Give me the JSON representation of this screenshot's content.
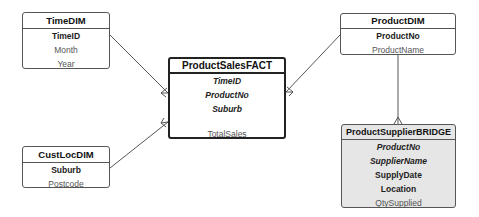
{
  "diagram": {
    "type": "star-schema-er",
    "entities": {
      "time_dim": {
        "title": "TimeDIM",
        "attributes": [
          {
            "name": "TimeID",
            "style": "pk"
          },
          {
            "name": "Month",
            "style": "plain"
          },
          {
            "name": "Year",
            "style": "plain"
          }
        ]
      },
      "cust_loc_dim": {
        "title": "CustLocDIM",
        "attributes": [
          {
            "name": "Suburb",
            "style": "pk"
          },
          {
            "name": "Postcode",
            "style": "plain"
          }
        ]
      },
      "product_sales_fact": {
        "title": "ProductSalesFACT",
        "attributes": [
          {
            "name": "TimeID",
            "style": "fk"
          },
          {
            "name": "ProductNo",
            "style": "fk"
          },
          {
            "name": "Suburb",
            "style": "fk"
          },
          {
            "name": "TotalSales",
            "style": "plain"
          }
        ]
      },
      "product_dim": {
        "title": "ProductDIM",
        "attributes": [
          {
            "name": "ProductNo",
            "style": "pk"
          },
          {
            "name": "ProductName",
            "style": "plain"
          }
        ]
      },
      "product_supplier_bridge": {
        "title": "ProductSupplierBRIDGE",
        "attributes": [
          {
            "name": "ProductNo",
            "style": "fk"
          },
          {
            "name": "SupplierName",
            "style": "fk"
          },
          {
            "name": "SupplyDate",
            "style": "pk"
          },
          {
            "name": "Location",
            "style": "pk"
          },
          {
            "name": "QtySupplied",
            "style": "plain"
          }
        ]
      }
    },
    "relationships": [
      {
        "from": "TimeDIM",
        "to": "ProductSalesFACT",
        "cardinality": "one-to-many"
      },
      {
        "from": "CustLocDIM",
        "to": "ProductSalesFACT",
        "cardinality": "one-to-many"
      },
      {
        "from": "ProductDIM",
        "to": "ProductSalesFACT",
        "cardinality": "one-to-many"
      },
      {
        "from": "ProductDIM",
        "to": "ProductSupplierBRIDGE",
        "cardinality": "one-to-many"
      }
    ],
    "colors": {
      "line": "#444444",
      "bridge_fill": "#e6e6e6",
      "border": "#555555"
    }
  }
}
